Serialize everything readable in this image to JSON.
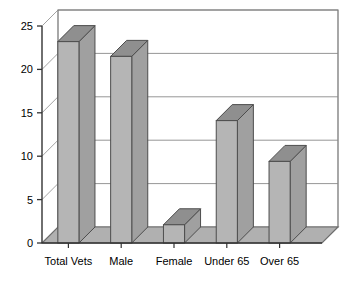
{
  "chart_data": {
    "type": "bar",
    "title": "",
    "subtitle": "",
    "xlabel": "",
    "ylabel": "",
    "categories": [
      "Total Vets",
      "Male",
      "Female",
      "Under 65",
      "Over 65"
    ],
    "values": [
      23.2,
      21.5,
      2.1,
      14.1,
      9.4
    ],
    "ylim": [
      0,
      25
    ],
    "ytick_labels": [
      "0",
      "5",
      "10",
      "15",
      "20",
      "25"
    ],
    "ytick_values": [
      0,
      5,
      10,
      15,
      20,
      25
    ],
    "grid": true,
    "grid_axis": "y",
    "legend": false,
    "legend_position": "none",
    "style": "3d-column",
    "colors": {
      "bar_face": "#b5b5b5",
      "bar_top": "#8f8f8f",
      "bar_side": "#a0a0a0",
      "bar_outline": "#4d4d4d",
      "floor": "#b0b0b0",
      "wall": "#ffffff",
      "wall_outline": "#6e6e6e",
      "gridline": "#8a8a8a",
      "axis": "#333333",
      "text": "#000000",
      "background": "#ffffff"
    }
  },
  "axes": {
    "y_axis_name": "value-axis",
    "x_axis_name": "category-axis"
  }
}
